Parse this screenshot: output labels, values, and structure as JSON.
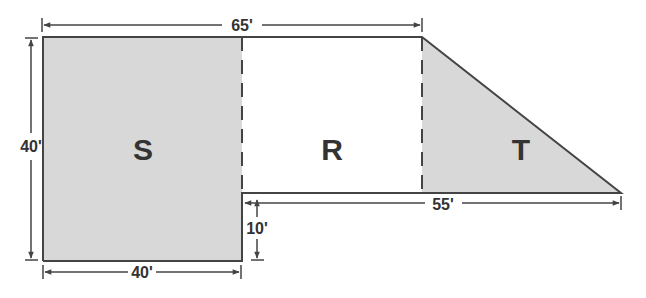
{
  "colors": {
    "shade": "#d8d8d8",
    "line": "#444444",
    "text": "#333333",
    "background": "#ffffff"
  },
  "regions": {
    "s": {
      "label": "S",
      "shape": "rectangle",
      "shaded": true
    },
    "r": {
      "label": "R",
      "shape": "rectangle",
      "shaded": false
    },
    "t": {
      "label": "T",
      "shape": "right-triangle",
      "shaded": true
    }
  },
  "dimensions": {
    "top_width": "65'",
    "left_height": "40'",
    "bottom_width": "40'",
    "step_height": "10'",
    "right_width": "55'"
  }
}
